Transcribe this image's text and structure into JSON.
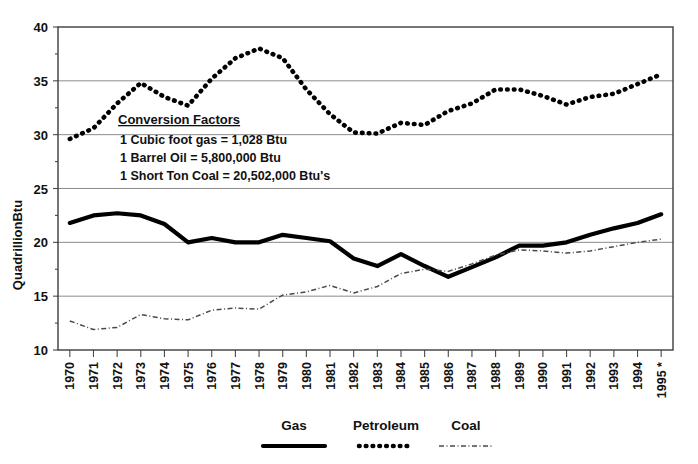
{
  "chart_data": {
    "type": "line",
    "title": "",
    "xlabel": "",
    "ylabel": "QuadrillionBtu",
    "ylim": [
      10,
      40
    ],
    "yticks": [
      10,
      15,
      20,
      25,
      30,
      35,
      40
    ],
    "grid": true,
    "legend_position": "bottom",
    "categories": [
      "1970",
      "1971",
      "1972",
      "1973",
      "1974",
      "1975",
      "1976",
      "1977",
      "1978",
      "1979",
      "1980",
      "1981",
      "1982",
      "1983",
      "1984",
      "1985",
      "1986",
      "1987",
      "1988",
      "1989",
      "1990",
      "1991",
      "1992",
      "1993",
      "1994",
      "1995 *"
    ],
    "series": [
      {
        "name": "Gas",
        "style": "solid-thick",
        "color": "#000000",
        "values": [
          21.8,
          22.5,
          22.7,
          22.5,
          21.7,
          20.0,
          20.4,
          20.0,
          20.0,
          20.7,
          20.4,
          20.1,
          18.5,
          17.8,
          18.9,
          17.8,
          16.8,
          17.7,
          18.6,
          19.7,
          19.7,
          20.0,
          20.7,
          21.3,
          21.8,
          22.6
        ]
      },
      {
        "name": "Petroleum",
        "style": "dotted-thick",
        "color": "#000000",
        "values": [
          29.6,
          30.6,
          32.9,
          34.8,
          33.5,
          32.7,
          35.2,
          37.1,
          38.0,
          37.1,
          34.2,
          31.9,
          30.2,
          30.1,
          31.1,
          30.9,
          32.2,
          32.9,
          34.2,
          34.2,
          33.6,
          32.8,
          33.5,
          33.8,
          34.7,
          35.6
        ]
      },
      {
        "name": "Coal",
        "style": "dashdot-thin",
        "color": "#4a4a4a",
        "values": [
          12.7,
          11.9,
          12.1,
          13.3,
          12.9,
          12.8,
          13.7,
          13.9,
          13.8,
          15.1,
          15.4,
          16.0,
          15.3,
          15.9,
          17.1,
          17.5,
          17.3,
          18.0,
          18.8,
          19.3,
          19.2,
          19.0,
          19.2,
          19.6,
          20.0,
          20.3
        ]
      }
    ],
    "annotation": {
      "heading": "Conversion Factors",
      "lines": [
        "1 Cubic foot gas = 1,028 Btu",
        "1 Barrel Oil = 5,800,000 Btu",
        "1 Short Ton Coal = 20,502,000 Btu's"
      ]
    }
  }
}
